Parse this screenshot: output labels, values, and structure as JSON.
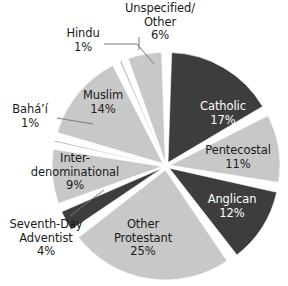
{
  "chart_data": {
    "type": "pie",
    "title": "",
    "subtitle": "",
    "xlabel": "",
    "ylabel": "",
    "legend_position": "none",
    "grid": false,
    "label_format": "name + percent",
    "start_angle_deg": 0,
    "direction": "clockwise",
    "categories": [
      "Catholic",
      "Pentecostal",
      "Anglican",
      "Other Protestant",
      "Seventh-Day Adventist",
      "Inter-denominational",
      "Bahá’í",
      "Muslim",
      "Hindu",
      "Unspecified/ Other"
    ],
    "values": [
      17,
      11,
      12,
      25,
      4,
      9,
      1,
      14,
      1,
      6
    ],
    "units": "percent",
    "total": 100,
    "slices": [
      {
        "name": "Catholic",
        "display_name": "Catholic",
        "percent_text": "17%",
        "value": 17,
        "fill": "#3d3d3d",
        "text_color": "#ffffff",
        "label_placement": "inside"
      },
      {
        "name": "Pentecostal",
        "display_name": "Pentecostal",
        "percent_text": "11%",
        "value": 11,
        "fill": "#c8c8c8",
        "text_color": "#1a1a1a",
        "label_placement": "inside"
      },
      {
        "name": "Anglican",
        "display_name": "Anglican",
        "percent_text": "12%",
        "value": 12,
        "fill": "#3d3d3d",
        "text_color": "#ffffff",
        "label_placement": "inside"
      },
      {
        "name": "Other Protestant",
        "display_name": "Other\nProtestant",
        "percent_text": "25%",
        "value": 25,
        "fill": "#c8c8c8",
        "text_color": "#1a1a1a",
        "label_placement": "inside"
      },
      {
        "name": "Seventh-Day Adventist",
        "display_name": "Seventh-Day\nAdventist",
        "percent_text": "4%",
        "value": 4,
        "fill": "#3d3d3d",
        "text_color": "#1a1a1a",
        "label_placement": "outside"
      },
      {
        "name": "Inter-denominational",
        "display_name": "Inter-\ndenominational",
        "percent_text": "9%",
        "value": 9,
        "fill": "#c8c8c8",
        "text_color": "#1a1a1a",
        "label_placement": "inside"
      },
      {
        "name": "Bahá’í",
        "display_name": "Bahá’í",
        "percent_text": "1%",
        "value": 1,
        "fill": "#3d3d3d",
        "text_color": "#1a1a1a",
        "label_placement": "outside"
      },
      {
        "name": "Muslim",
        "display_name": "Muslim",
        "percent_text": "14%",
        "value": 14,
        "fill": "#c8c8c8",
        "text_color": "#1a1a1a",
        "label_placement": "inside"
      },
      {
        "name": "Hindu",
        "display_name": "Hindu",
        "percent_text": "1%",
        "value": 1,
        "fill": "#3d3d3d",
        "text_color": "#1a1a1a",
        "label_placement": "outside"
      },
      {
        "name": "Unspecified/ Other",
        "display_name": "Unspecified/\nOther",
        "percent_text": "6%",
        "value": 6,
        "fill": "#c8c8c8",
        "text_color": "#1a1a1a",
        "label_placement": "outside"
      }
    ]
  },
  "labels": {
    "unspecified": {
      "line1": "Unspecified/",
      "line2": "Other",
      "pct": "6%"
    },
    "hindu": {
      "line1": "Hindu",
      "pct": "1%"
    },
    "bahai": {
      "line1": "Bahá’í",
      "pct": "1%"
    },
    "sda": {
      "line1": "Seventh-Day",
      "line2": "Adventist",
      "pct": "4%"
    },
    "catholic": {
      "line1": "Catholic",
      "pct": "17%"
    },
    "pentecostal": {
      "line1": "Pentecostal",
      "pct": "11%"
    },
    "anglican": {
      "line1": "Anglican",
      "pct": "12%"
    },
    "otherprot": {
      "line1": "Other",
      "line2": "Protestant",
      "pct": "25%"
    },
    "interdenom": {
      "line1": "Inter-",
      "line2": "denominational",
      "pct": "9%"
    },
    "muslim": {
      "line1": "Muslim",
      "pct": "14%"
    }
  },
  "colors": {
    "dark_slice": "#3d3d3d",
    "light_slice": "#c8c8c8",
    "separator": "#ffffff",
    "background": "#ffffff",
    "leader_line": "#7a7a7a",
    "text": "#1a1a1a",
    "text_on_dark": "#ffffff"
  }
}
